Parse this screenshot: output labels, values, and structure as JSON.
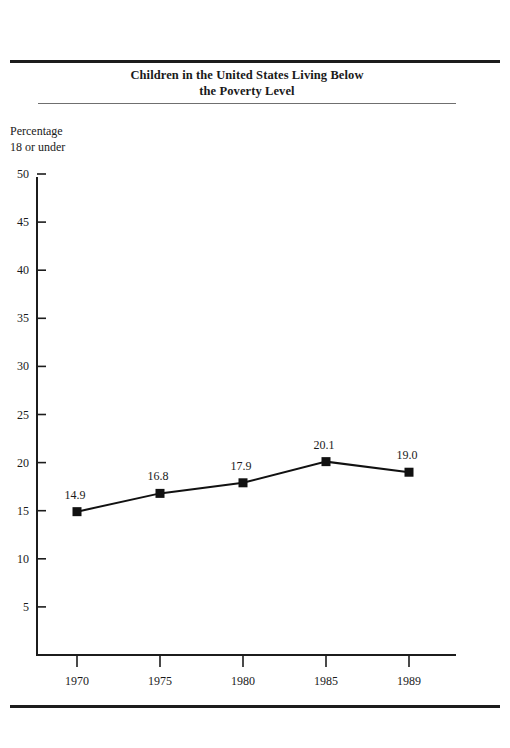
{
  "title": {
    "line1": "Children in the United States Living Below",
    "line2": "the Poverty Level"
  },
  "axis_caption": {
    "line1": "Percentage",
    "line2": "18 or under"
  },
  "chart_data": {
    "type": "line",
    "title": "Children in the United States Living Below the Poverty Level",
    "subtitle": "",
    "xlabel": "",
    "ylabel": "Percentage 18 or under",
    "categories": [
      "1970",
      "1975",
      "1980",
      "1985",
      "1989"
    ],
    "x": [
      1970,
      1975,
      1980,
      1985,
      1989
    ],
    "values": [
      14.9,
      16.8,
      17.9,
      20.1,
      19.0
    ],
    "point_labels": [
      "14.9",
      "16.8",
      "17.9",
      "20.1",
      "19.0"
    ],
    "series": [
      {
        "name": "Percentage 18 or under below poverty level",
        "values": [
          14.9,
          16.8,
          17.9,
          20.1,
          19.0
        ]
      }
    ],
    "ylim": [
      0,
      50
    ],
    "yticks": [
      5,
      10,
      15,
      20,
      25,
      30,
      35,
      40,
      45,
      50
    ],
    "ytick_labels": [
      "5",
      "10",
      "15",
      "20",
      "25",
      "30",
      "35",
      "40",
      "45",
      "50"
    ],
    "xtick_labels": [
      "1970",
      "1975",
      "1980",
      "1985",
      "1989"
    ],
    "grid": false,
    "legend": "none",
    "marker": "square",
    "line_color": "#111111",
    "marker_color": "#111111"
  },
  "colors": {
    "ink": "#1a1a1a",
    "rule_heavy": "#1c1c1c",
    "rule_light": "#6f6f6f"
  }
}
